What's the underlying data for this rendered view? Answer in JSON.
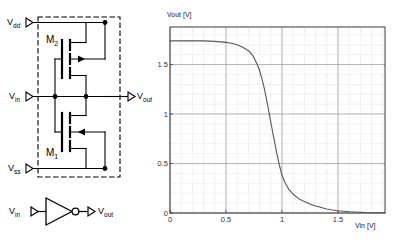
{
  "schematic": {
    "title_hidden": "",
    "terminals": [
      {
        "name": "vdd",
        "base": "V",
        "sub": "dd"
      },
      {
        "name": "vin",
        "base": "V",
        "sub": "in"
      },
      {
        "name": "vss",
        "base": "V",
        "sub": "ss"
      },
      {
        "name": "vout",
        "base": "V",
        "sub": "out"
      }
    ],
    "devices": [
      {
        "name": "M2",
        "base": "M",
        "sub": "2",
        "type": "pmos"
      },
      {
        "name": "M1",
        "base": "M",
        "sub": "1",
        "type": "nmos"
      }
    ],
    "boundary": "dashed-rectangle"
  },
  "inverter_symbol": {
    "input_label_base": "V",
    "input_label_sub": "in",
    "output_label_base": "V",
    "output_label_sub": "out",
    "shape": "triangle-with-bubble"
  },
  "chart_data": {
    "type": "line",
    "title": "",
    "xlabel": "Vin [V]",
    "ylabel": "Vout [V]",
    "xlim": [
      0,
      1.92
    ],
    "ylim": [
      0,
      1.88
    ],
    "xticks": [
      0,
      0.5,
      1,
      1.5
    ],
    "xticklabels": [
      "0",
      "0.5",
      "1",
      "1.5"
    ],
    "yticks": [
      0,
      0.5,
      1,
      1.5
    ],
    "yticklabels": [
      "0",
      "0.5",
      "1",
      "1.5"
    ],
    "grid": true,
    "minor_grid": true,
    "legend": null,
    "line_color": "#555555",
    "series": [
      {
        "name": "VTC",
        "x": [
          0.0,
          0.1,
          0.2,
          0.3,
          0.4,
          0.45,
          0.5,
          0.55,
          0.6,
          0.65,
          0.7,
          0.74,
          0.78,
          0.8,
          0.82,
          0.84,
          0.86,
          0.88,
          0.9,
          0.92,
          0.94,
          0.96,
          0.98,
          1.0,
          1.03,
          1.06,
          1.1,
          1.15,
          1.2,
          1.25,
          1.3,
          1.35,
          1.4,
          1.45,
          1.5,
          1.6,
          1.75,
          1.92
        ],
        "y": [
          1.74,
          1.74,
          1.74,
          1.74,
          1.735,
          1.73,
          1.725,
          1.715,
          1.7,
          1.675,
          1.64,
          1.59,
          1.5,
          1.44,
          1.36,
          1.27,
          1.16,
          1.04,
          0.92,
          0.8,
          0.68,
          0.57,
          0.47,
          0.38,
          0.3,
          0.24,
          0.19,
          0.145,
          0.115,
          0.09,
          0.07,
          0.055,
          0.04,
          0.03,
          0.022,
          0.012,
          0.005,
          0.002
        ]
      }
    ]
  }
}
